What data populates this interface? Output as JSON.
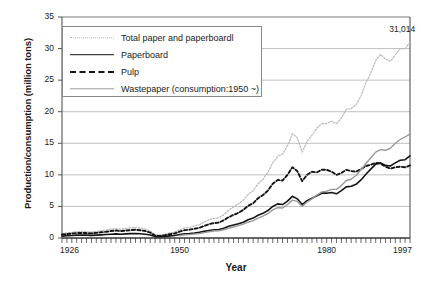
{
  "chart_data": {
    "type": "line",
    "title": "",
    "xlabel": "Year",
    "ylabel": "Production/consumption (million tons)",
    "xlim": [
      1926,
      1997
    ],
    "ylim": [
      0,
      35
    ],
    "yticks": [
      0,
      5,
      10,
      15,
      20,
      25,
      30,
      35
    ],
    "xticks": [
      1926,
      1950,
      1980,
      1997
    ],
    "xtick_labels": [
      "1926",
      "1950",
      "1980",
      "1997"
    ],
    "ytick_labels": [
      "0",
      "5",
      "10",
      "15",
      "20",
      "25",
      "30",
      "35"
    ],
    "grid": "horizontal",
    "legend_position": "upper-left-inside",
    "minor_xticks": "every year",
    "annotations": [
      {
        "text": "31,014",
        "x": 1995,
        "y": 31.0,
        "series": "Total paper and paperboardl"
      }
    ],
    "x": [
      1926,
      1927,
      1928,
      1929,
      1930,
      1931,
      1932,
      1933,
      1934,
      1935,
      1936,
      1937,
      1938,
      1939,
      1940,
      1941,
      1942,
      1943,
      1944,
      1945,
      1946,
      1947,
      1948,
      1949,
      1950,
      1951,
      1952,
      1953,
      1954,
      1955,
      1956,
      1957,
      1958,
      1959,
      1960,
      1961,
      1962,
      1963,
      1964,
      1965,
      1966,
      1967,
      1968,
      1969,
      1970,
      1971,
      1972,
      1973,
      1974,
      1975,
      1976,
      1977,
      1978,
      1979,
      1980,
      1981,
      1982,
      1983,
      1984,
      1985,
      1986,
      1987,
      1988,
      1989,
      1990,
      1991,
      1992,
      1993,
      1994,
      1995,
      1996,
      1997
    ],
    "series": [
      {
        "name": "Total paper and paperboardl",
        "style": "fine-dotted",
        "color": "#b8b8b8",
        "values": [
          0.7,
          0.8,
          0.9,
          1.0,
          1.0,
          1.0,
          0.95,
          1.05,
          1.15,
          1.25,
          1.4,
          1.5,
          1.4,
          1.5,
          1.6,
          1.65,
          1.55,
          1.4,
          1.1,
          0.5,
          0.45,
          0.6,
          0.8,
          0.95,
          1.3,
          1.6,
          1.7,
          1.9,
          2.1,
          2.5,
          2.9,
          3.1,
          3.2,
          3.7,
          4.4,
          4.9,
          5.4,
          6.0,
          6.9,
          7.5,
          8.6,
          9.3,
          10.4,
          11.9,
          12.9,
          13.3,
          14.6,
          16.5,
          15.9,
          13.6,
          15.3,
          16.3,
          17.4,
          18.1,
          18.1,
          18.5,
          18.1,
          19.0,
          20.4,
          20.5,
          21.1,
          22.5,
          24.6,
          26.1,
          28.1,
          29.1,
          28.3,
          28.0,
          29.0,
          30.0,
          30.0,
          31.0
        ]
      },
      {
        "name": "Paperboard",
        "style": "solid",
        "color": "#141414",
        "values": [
          0.3,
          0.35,
          0.4,
          0.45,
          0.45,
          0.45,
          0.42,
          0.46,
          0.5,
          0.55,
          0.6,
          0.65,
          0.6,
          0.65,
          0.7,
          0.72,
          0.68,
          0.6,
          0.48,
          0.22,
          0.2,
          0.26,
          0.34,
          0.4,
          0.55,
          0.68,
          0.72,
          0.8,
          0.9,
          1.05,
          1.2,
          1.3,
          1.35,
          1.55,
          1.85,
          2.05,
          2.25,
          2.5,
          2.9,
          3.15,
          3.6,
          3.9,
          4.35,
          5.0,
          5.4,
          5.3,
          5.85,
          6.6,
          6.2,
          5.3,
          5.9,
          6.3,
          6.7,
          7.1,
          7.1,
          7.2,
          7.0,
          7.5,
          8.1,
          8.2,
          8.5,
          9.2,
          10.1,
          10.9,
          11.7,
          11.9,
          11.5,
          11.4,
          11.9,
          12.3,
          12.4,
          13.0
        ]
      },
      {
        "name": "Pulp",
        "style": "dashed",
        "color": "#141414",
        "values": [
          0.55,
          0.62,
          0.7,
          0.78,
          0.78,
          0.78,
          0.74,
          0.82,
          0.9,
          0.98,
          1.1,
          1.18,
          1.1,
          1.18,
          1.25,
          1.3,
          1.22,
          1.1,
          0.85,
          0.38,
          0.34,
          0.45,
          0.6,
          0.72,
          1.0,
          1.25,
          1.32,
          1.45,
          1.6,
          1.9,
          2.2,
          2.35,
          2.45,
          2.8,
          3.3,
          3.65,
          4.0,
          4.45,
          5.1,
          5.5,
          6.3,
          6.8,
          7.5,
          8.6,
          9.2,
          9.1,
          10.0,
          11.2,
          10.6,
          9.0,
          10.0,
          10.5,
          10.4,
          10.8,
          10.8,
          10.5,
          10.0,
          10.3,
          10.8,
          10.6,
          10.5,
          10.9,
          11.4,
          11.6,
          11.9,
          11.8,
          11.3,
          11.0,
          11.2,
          11.3,
          11.2,
          11.5
        ]
      },
      {
        "name": "Wastepaper (consumption:1950 ~)",
        "style": "solid",
        "color": "#9a9a9a",
        "values": [
          null,
          null,
          null,
          null,
          null,
          null,
          null,
          null,
          null,
          null,
          null,
          null,
          null,
          null,
          null,
          null,
          null,
          null,
          null,
          null,
          null,
          null,
          null,
          null,
          0.4,
          0.5,
          0.55,
          0.62,
          0.7,
          0.85,
          1.0,
          1.1,
          1.15,
          1.3,
          1.55,
          1.75,
          1.95,
          2.2,
          2.5,
          2.75,
          3.15,
          3.45,
          3.85,
          4.45,
          4.8,
          4.75,
          5.3,
          6.0,
          5.8,
          5.0,
          5.7,
          6.2,
          6.8,
          7.3,
          7.4,
          7.7,
          7.7,
          8.3,
          9.1,
          9.3,
          9.9,
          10.8,
          11.8,
          12.7,
          13.6,
          14.0,
          13.9,
          14.2,
          15.0,
          15.6,
          16.0,
          16.5
        ]
      }
    ]
  },
  "axis": {
    "ylabel": "Production/consumption (million tons)",
    "xlabel": "Year"
  },
  "legend": {
    "items": [
      {
        "label": "Total paper and paperboardl",
        "key": "total"
      },
      {
        "label": "Paperboard",
        "key": "paperboard"
      },
      {
        "label": "Pulp",
        "key": "pulp"
      },
      {
        "label": "Wastepaper (consumption:1950 ~)",
        "key": "wastepaper"
      }
    ]
  },
  "colors": {
    "total": "#b8b8b8",
    "paperboard": "#141414",
    "pulp": "#141414",
    "wastepaper": "#9a9a9a",
    "grid": "#b0b0b0",
    "axis": "#555555"
  }
}
